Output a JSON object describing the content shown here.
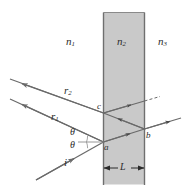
{
  "figure": {
    "colors": {
      "background": "#ffffff",
      "slab_fill": "#c9c9c9",
      "slab_edge": "#6f6f6f",
      "ray_stroke": "#6a6a6a",
      "label_color": "#2b2b2b"
    },
    "media_labels": [
      {
        "name": "medium-1-index",
        "text": "n",
        "sub": "1"
      },
      {
        "name": "medium-2-index",
        "text": "n",
        "sub": "2"
      },
      {
        "name": "medium-3-index",
        "text": "n",
        "sub": "3"
      }
    ],
    "ray_labels": [
      {
        "name": "reflected-ray-2-label",
        "text": "r",
        "sub": "2"
      },
      {
        "name": "reflected-ray-1-label",
        "text": "r",
        "sub": "1"
      },
      {
        "name": "incident-ray-label",
        "text": "i",
        "sub": ""
      }
    ],
    "angle_labels": [
      {
        "name": "angle-theta-upper",
        "text": "θ"
      },
      {
        "name": "angle-theta-lower",
        "text": "θ"
      }
    ],
    "point_labels": [
      {
        "name": "point-a-label",
        "text": "a"
      },
      {
        "name": "point-b-label",
        "text": "b"
      },
      {
        "name": "point-c-label",
        "text": "c"
      }
    ],
    "dimension": {
      "name": "slab-thickness-label",
      "text": "L"
    }
  }
}
